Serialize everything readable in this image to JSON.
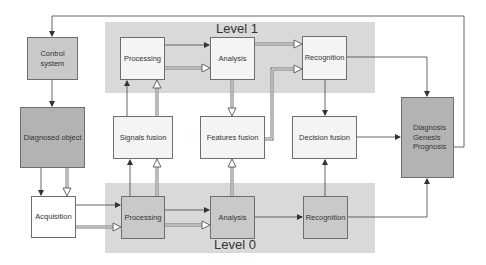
{
  "diagram": {
    "levels": [
      {
        "id": "level1",
        "label": "Level 1"
      },
      {
        "id": "level0",
        "label": "Level 0"
      }
    ],
    "nodes": {
      "control_system": "Control system",
      "diagnosed_object": "Diagnosed object",
      "acquisition": "Acquisition",
      "l1_processing": "Processing",
      "l1_analysis": "Analysis",
      "l1_recognition": "Recognition",
      "signals_fusion": "Signals fusion",
      "features_fusion": "Features fusion",
      "decision_fusion": "Decision fusion",
      "l0_processing": "Processing",
      "l0_analysis": "Analysis",
      "l0_recognition": "Recognition",
      "output": {
        "line1": "Diagnosis",
        "line2": "Genesis",
        "line3": "Prognosis"
      }
    },
    "edges": [
      {
        "from": "output",
        "to": "control_system",
        "style": "solid-arrow"
      },
      {
        "from": "control_system",
        "to": "diagnosed_object",
        "style": "solid-arrow"
      },
      {
        "from": "diagnosed_object",
        "to": "acquisition",
        "style": "solid-arrow"
      },
      {
        "from": "diagnosed_object",
        "to": "acquisition",
        "style": "hollow-double-arrow"
      },
      {
        "from": "acquisition",
        "to": "l0_processing",
        "style": "solid-arrow"
      },
      {
        "from": "acquisition",
        "to": "l0_processing",
        "style": "hollow-double-arrow"
      },
      {
        "from": "l0_processing",
        "to": "l0_analysis",
        "style": "solid-arrow"
      },
      {
        "from": "l0_processing",
        "to": "l0_analysis",
        "style": "hollow-double-arrow"
      },
      {
        "from": "l0_analysis",
        "to": "l0_recognition",
        "style": "solid-arrow"
      },
      {
        "from": "l0_recognition",
        "to": "output",
        "style": "solid-arrow"
      },
      {
        "from": "l0_processing",
        "to": "signals_fusion",
        "style": "solid-arrow"
      },
      {
        "from": "l0_processing",
        "to": "signals_fusion",
        "style": "hollow-double-arrow"
      },
      {
        "from": "l0_analysis",
        "to": "features_fusion",
        "style": "hollow-double-arrow"
      },
      {
        "from": "l0_recognition",
        "to": "decision_fusion",
        "style": "solid-arrow"
      },
      {
        "from": "signals_fusion",
        "to": "l1_processing",
        "style": "solid-arrow"
      },
      {
        "from": "signals_fusion",
        "to": "l1_processing",
        "style": "hollow-double-arrow"
      },
      {
        "from": "l1_processing",
        "to": "l1_analysis",
        "style": "solid-arrow"
      },
      {
        "from": "l1_processing",
        "to": "l1_analysis",
        "style": "hollow-double-arrow"
      },
      {
        "from": "l1_analysis",
        "to": "l1_recognition",
        "style": "hollow-double-arrow"
      },
      {
        "from": "l1_analysis",
        "to": "features_fusion",
        "style": "hollow-double-arrow"
      },
      {
        "from": "features_fusion",
        "to": "l1_recognition",
        "style": "hollow-double-arrow"
      },
      {
        "from": "l1_recognition",
        "to": "decision_fusion",
        "style": "solid-arrow"
      },
      {
        "from": "l1_recognition",
        "to": "output",
        "style": "solid-arrow"
      },
      {
        "from": "decision_fusion",
        "to": "output",
        "style": "solid-arrow"
      }
    ],
    "colors": {
      "band": "#d9d9d9",
      "light_box": "#f4f4f4",
      "mid_box": "#c9c9c9",
      "dark_box": "#b3b3b3",
      "line": "#555555"
    }
  }
}
